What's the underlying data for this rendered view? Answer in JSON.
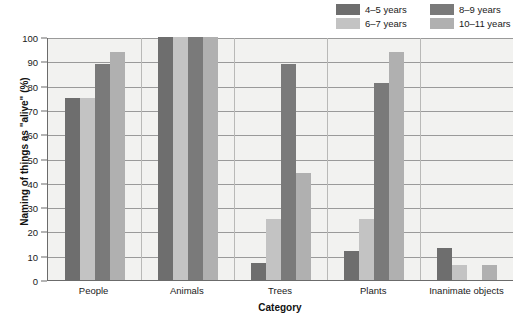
{
  "chart_data": {
    "type": "bar",
    "title": "",
    "xlabel": "Category",
    "ylabel": "Naming of things as \"alive\" (%)",
    "ylim": [
      0,
      100
    ],
    "ytick_step": 10,
    "yticks": [
      100,
      90,
      80,
      70,
      60,
      50,
      40,
      30,
      20,
      10,
      0
    ],
    "grid": true,
    "legend_position": "top-right",
    "categories": [
      "People",
      "Animals",
      "Trees",
      "Plants",
      "Inanimate objects"
    ],
    "series": [
      {
        "name": "4–5 years",
        "color": "#6e6e6e",
        "values": [
          75,
          100,
          7,
          12,
          13
        ]
      },
      {
        "name": "6–7 years",
        "color": "#c3c3c3",
        "values": [
          75,
          100,
          25,
          25,
          6
        ]
      },
      {
        "name": "8–9 years",
        "color": "#7a7a7a",
        "values": [
          89,
          100,
          89,
          81,
          0
        ]
      },
      {
        "name": "10–11 years",
        "color": "#b0b0b0",
        "values": [
          94,
          100,
          44,
          94,
          6
        ]
      }
    ]
  },
  "legend": {
    "items": [
      {
        "label": "4–5 years",
        "swatch": "#6e6e6e"
      },
      {
        "label": "8–9 years",
        "swatch": "#7a7a7a"
      },
      {
        "label": "6–7 years",
        "swatch": "#c3c3c3"
      },
      {
        "label": "10–11 years",
        "swatch": "#b0b0b0"
      }
    ]
  },
  "axes": {
    "y_title": "Naming of things as \"alive\" (%)",
    "x_title": "Category",
    "y_tick_labels": [
      "100",
      "90",
      "80",
      "70",
      "60",
      "50",
      "40",
      "30",
      "20",
      "10",
      "0"
    ],
    "x_tick_labels": [
      "People",
      "Animals",
      "Trees",
      "Plants",
      "Inanimate objects"
    ]
  },
  "colors": {
    "plot_background": "#f2f2f0",
    "axis_line": "#6b6b6b",
    "gridline": "#9a9a9a",
    "separator": "#b9b9b7",
    "text": "#1a1a1a"
  }
}
